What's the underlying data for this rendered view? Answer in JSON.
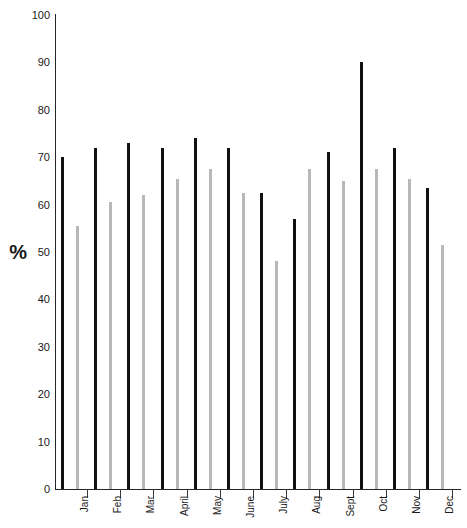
{
  "chart_data": {
    "type": "bar",
    "title": "",
    "subtitle": "",
    "xlabel": "",
    "ylabel": "%",
    "ylim": [
      0,
      100
    ],
    "yticks": [
      0,
      10,
      20,
      30,
      40,
      50,
      60,
      70,
      80,
      90,
      100
    ],
    "ytick_labels": [
      "0",
      "10",
      "20",
      "30",
      "40",
      "50",
      "60",
      "70",
      "80",
      "90",
      "100"
    ],
    "grid": false,
    "legend": "none",
    "categories": [
      "Jan",
      "Feb",
      "Mar",
      "April",
      "May",
      "June",
      "July",
      "Aug",
      "Sept",
      "Oct",
      "Nov",
      "Dec"
    ],
    "series": [
      {
        "name": "series-1",
        "color": "#111111",
        "values": [
          70,
          72,
          73,
          72,
          74,
          72,
          62.5,
          57,
          71,
          90,
          72,
          63.5
        ]
      },
      {
        "name": "series-2",
        "color": "#b8b8b8",
        "values": [
          55.5,
          60.5,
          62,
          65.5,
          67.5,
          62.5,
          48,
          67.5,
          65,
          67.5,
          65.5,
          51.5
        ]
      }
    ]
  },
  "axes": {
    "y_label_text": "%",
    "y_min": 0,
    "y_max": 100
  }
}
